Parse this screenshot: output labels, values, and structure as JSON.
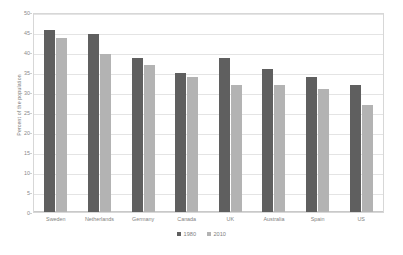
{
  "chart_data": {
    "type": "bar",
    "title": "",
    "xlabel": "",
    "ylabel": "Percent of the population",
    "ylim": [
      0,
      50
    ],
    "ytick_step": 5,
    "yticks": [
      0,
      5,
      10,
      15,
      20,
      25,
      30,
      35,
      40,
      45,
      50
    ],
    "grid": true,
    "legend_position": "bottom",
    "categories": [
      "Sweden",
      "Netherlands",
      "Germany",
      "Canada",
      "UK",
      "Australia",
      "Spain",
      "US"
    ],
    "series": [
      {
        "name": "1980",
        "color": "#5f5f5f",
        "values": [
          46,
          45,
          39,
          35,
          39,
          36,
          34,
          32
        ]
      },
      {
        "name": "2010",
        "color": "#b3b3b3",
        "values": [
          44,
          40,
          37,
          34,
          32,
          32,
          31,
          27
        ]
      }
    ]
  },
  "axis": {
    "y_title": "Percent of the population"
  },
  "colors": {
    "series_1980": "#5f5f5f",
    "series_2010": "#b3b3b3",
    "gridline": "#e4e4e4",
    "plot_border": "#d7d7d7",
    "text": "#7f7f7f",
    "background": "#ffffff"
  }
}
